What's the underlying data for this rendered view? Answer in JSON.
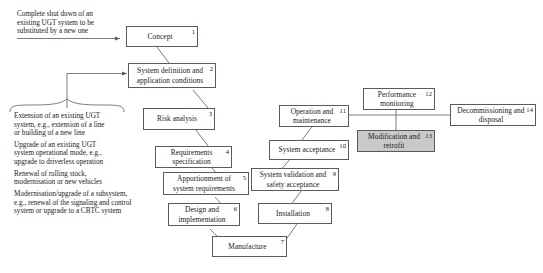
{
  "diagram": {
    "background_color": "#ffffff",
    "border_color": "#5a5a5a",
    "shaded_fill": "#c9c9c9",
    "annotations": {
      "top_left_note": "Complete shut down of an\nexisting UGT system to be\nsubstituted by a new one",
      "bullet_list": [
        "Extension of an existing UGT\nsystem, e.g., extension of a line\nor building of a new line",
        "Upgrade of an existing UGT\nsystem operational mode, e.g.,\nupgrade to driverless operation",
        "Renewal of rolling stock,\nmodernisation or new vehicles",
        "Modernisation/upgrade of a subsystem,\ne.g., renewal of the signaling and control\nsystem or upgrade to a CBTC system"
      ]
    },
    "nodes": [
      {
        "id": "concept",
        "number": "1",
        "label": "Concept",
        "shaded": false
      },
      {
        "id": "system-definition",
        "number": "2",
        "label": "System definition\nand application conditions",
        "shaded": false
      },
      {
        "id": "risk-analysis",
        "number": "3",
        "label": "Risk analysis",
        "shaded": false
      },
      {
        "id": "requirements",
        "number": "4",
        "label": "Requirements\nspecification",
        "shaded": false
      },
      {
        "id": "apportionment",
        "number": "5",
        "label": "Apportionment of\nsystem requirements",
        "shaded": false
      },
      {
        "id": "design",
        "number": "6",
        "label": "Design and\nimplementation",
        "shaded": false
      },
      {
        "id": "manufacture",
        "number": "7",
        "label": "Manufacture",
        "shaded": false
      },
      {
        "id": "installation",
        "number": "8",
        "label": "Installation",
        "shaded": false
      },
      {
        "id": "system-validation",
        "number": "9",
        "label": "System validation\nand safety acceptance",
        "shaded": false
      },
      {
        "id": "system-acceptance",
        "number": "10",
        "label": "System acceptance",
        "shaded": false
      },
      {
        "id": "operation-maintenance",
        "number": "11",
        "label": "Operation and\nmaintenance",
        "shaded": false
      },
      {
        "id": "performance-monitoring",
        "number": "12",
        "label": "Performance\nmonitoring",
        "shaded": false
      },
      {
        "id": "modification-retrofit",
        "number": "13",
        "label": "Modification\nand retrofit",
        "shaded": true
      },
      {
        "id": "decommissioning",
        "number": "14",
        "label": "Decommissioning\nand disposal",
        "shaded": false
      }
    ]
  }
}
